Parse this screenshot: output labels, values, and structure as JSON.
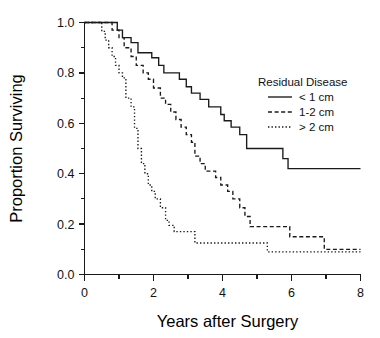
{
  "chart_data": {
    "type": "line",
    "title": "",
    "xlabel": "Years after Surgery",
    "ylabel": "Proportion Surviving",
    "xlim": [
      0,
      8
    ],
    "ylim": [
      0,
      1
    ],
    "grid": false,
    "legend_position": "right-top",
    "legend_title": "Residual Disease",
    "x_ticks_major": [
      0,
      2,
      4,
      6,
      8
    ],
    "x_ticklabels": [
      "0",
      "2",
      "4",
      "6",
      "8"
    ],
    "x_ticks_minor": [
      1,
      3,
      5,
      7
    ],
    "y_ticks_major": [
      0.0,
      0.2,
      0.4,
      0.6,
      0.8,
      1.0
    ],
    "y_ticklabels": [
      "0.0",
      "0.2",
      "0.4",
      "0.6",
      "0.8",
      "1.0"
    ],
    "y_ticks_minor": [
      0.1,
      0.3,
      0.5,
      0.7,
      0.9
    ],
    "series": [
      {
        "name": "< 1 cm",
        "style": "solid",
        "color": "#1a1a1a",
        "points": [
          [
            0.0,
            1.0
          ],
          [
            0.95,
            1.0
          ],
          [
            0.95,
            0.97
          ],
          [
            1.1,
            0.97
          ],
          [
            1.1,
            0.94
          ],
          [
            1.35,
            0.94
          ],
          [
            1.35,
            0.92
          ],
          [
            1.55,
            0.92
          ],
          [
            1.55,
            0.88
          ],
          [
            1.95,
            0.88
          ],
          [
            1.95,
            0.86
          ],
          [
            2.15,
            0.86
          ],
          [
            2.15,
            0.83
          ],
          [
            2.3,
            0.83
          ],
          [
            2.3,
            0.8
          ],
          [
            2.75,
            0.8
          ],
          [
            2.75,
            0.775
          ],
          [
            2.95,
            0.775
          ],
          [
            2.95,
            0.745
          ],
          [
            3.1,
            0.745
          ],
          [
            3.1,
            0.72
          ],
          [
            3.35,
            0.72
          ],
          [
            3.35,
            0.695
          ],
          [
            3.6,
            0.695
          ],
          [
            3.6,
            0.665
          ],
          [
            3.95,
            0.665
          ],
          [
            3.95,
            0.635
          ],
          [
            4.05,
            0.635
          ],
          [
            4.05,
            0.61
          ],
          [
            4.25,
            0.61
          ],
          [
            4.25,
            0.585
          ],
          [
            4.5,
            0.585
          ],
          [
            4.5,
            0.555
          ],
          [
            4.7,
            0.555
          ],
          [
            4.7,
            0.5
          ],
          [
            5.75,
            0.5
          ],
          [
            5.75,
            0.46
          ],
          [
            5.9,
            0.46
          ],
          [
            5.9,
            0.42
          ],
          [
            8.0,
            0.42
          ]
        ]
      },
      {
        "name": "1-2 cm",
        "style": "dashed",
        "color": "#1a1a1a",
        "points": [
          [
            0.0,
            1.0
          ],
          [
            0.8,
            1.0
          ],
          [
            0.8,
            0.97
          ],
          [
            1.0,
            0.97
          ],
          [
            1.0,
            0.94
          ],
          [
            1.15,
            0.94
          ],
          [
            1.15,
            0.9
          ],
          [
            1.35,
            0.9
          ],
          [
            1.35,
            0.865
          ],
          [
            1.5,
            0.865
          ],
          [
            1.5,
            0.83
          ],
          [
            1.7,
            0.83
          ],
          [
            1.7,
            0.8
          ],
          [
            1.85,
            0.8
          ],
          [
            1.85,
            0.775
          ],
          [
            2.0,
            0.775
          ],
          [
            2.0,
            0.74
          ],
          [
            2.2,
            0.74
          ],
          [
            2.2,
            0.7
          ],
          [
            2.35,
            0.7
          ],
          [
            2.35,
            0.675
          ],
          [
            2.5,
            0.675
          ],
          [
            2.5,
            0.645
          ],
          [
            2.65,
            0.645
          ],
          [
            2.65,
            0.615
          ],
          [
            2.8,
            0.615
          ],
          [
            2.8,
            0.585
          ],
          [
            2.95,
            0.585
          ],
          [
            2.95,
            0.555
          ],
          [
            3.1,
            0.555
          ],
          [
            3.1,
            0.525
          ],
          [
            3.2,
            0.525
          ],
          [
            3.2,
            0.47
          ],
          [
            3.35,
            0.47
          ],
          [
            3.35,
            0.44
          ],
          [
            3.5,
            0.44
          ],
          [
            3.5,
            0.41
          ],
          [
            3.8,
            0.41
          ],
          [
            3.8,
            0.385
          ],
          [
            3.95,
            0.385
          ],
          [
            3.95,
            0.355
          ],
          [
            4.15,
            0.355
          ],
          [
            4.15,
            0.33
          ],
          [
            4.3,
            0.33
          ],
          [
            4.3,
            0.3
          ],
          [
            4.5,
            0.3
          ],
          [
            4.5,
            0.265
          ],
          [
            4.65,
            0.265
          ],
          [
            4.65,
            0.23
          ],
          [
            4.8,
            0.23
          ],
          [
            4.8,
            0.19
          ],
          [
            5.95,
            0.19
          ],
          [
            5.95,
            0.15
          ],
          [
            6.95,
            0.15
          ],
          [
            6.95,
            0.1
          ],
          [
            8.0,
            0.1
          ]
        ]
      },
      {
        "name": "> 2 cm",
        "style": "dotted",
        "color": "#1a1a1a",
        "points": [
          [
            0.0,
            1.0
          ],
          [
            0.5,
            1.0
          ],
          [
            0.5,
            0.965
          ],
          [
            0.6,
            0.965
          ],
          [
            0.6,
            0.93
          ],
          [
            0.7,
            0.93
          ],
          [
            0.7,
            0.9
          ],
          [
            0.8,
            0.9
          ],
          [
            0.8,
            0.865
          ],
          [
            0.9,
            0.865
          ],
          [
            0.9,
            0.83
          ],
          [
            1.0,
            0.83
          ],
          [
            1.0,
            0.8
          ],
          [
            1.1,
            0.8
          ],
          [
            1.1,
            0.78
          ],
          [
            1.2,
            0.78
          ],
          [
            1.2,
            0.7
          ],
          [
            1.35,
            0.7
          ],
          [
            1.35,
            0.665
          ],
          [
            1.45,
            0.665
          ],
          [
            1.45,
            0.58
          ],
          [
            1.55,
            0.58
          ],
          [
            1.55,
            0.5
          ],
          [
            1.65,
            0.5
          ],
          [
            1.65,
            0.44
          ],
          [
            1.75,
            0.44
          ],
          [
            1.75,
            0.4
          ],
          [
            1.85,
            0.4
          ],
          [
            1.85,
            0.355
          ],
          [
            1.95,
            0.355
          ],
          [
            1.95,
            0.33
          ],
          [
            2.05,
            0.33
          ],
          [
            2.05,
            0.3
          ],
          [
            2.2,
            0.3
          ],
          [
            2.2,
            0.265
          ],
          [
            2.35,
            0.265
          ],
          [
            2.35,
            0.215
          ],
          [
            2.45,
            0.215
          ],
          [
            2.45,
            0.195
          ],
          [
            2.6,
            0.195
          ],
          [
            2.6,
            0.17
          ],
          [
            3.2,
            0.17
          ],
          [
            3.2,
            0.125
          ],
          [
            5.3,
            0.125
          ],
          [
            5.3,
            0.09
          ],
          [
            8.0,
            0.09
          ]
        ]
      }
    ]
  },
  "legend": {
    "title": "Residual Disease",
    "entries": [
      {
        "label": "< 1 cm",
        "style": "solid"
      },
      {
        "label": "1-2 cm",
        "style": "dashed"
      },
      {
        "label": "> 2 cm",
        "style": "dotted"
      }
    ]
  },
  "axes": {
    "x_title": "Years after Surgery",
    "y_title": "Proportion Surviving"
  }
}
